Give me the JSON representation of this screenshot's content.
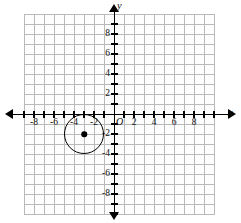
{
  "figure": {
    "type": "coordinate-plane",
    "x_axis_name": "x",
    "y_axis_name": "y",
    "origin_label": "O"
  },
  "axes": {
    "x_range": [
      -9,
      10
    ],
    "y_range": [
      -10,
      9
    ],
    "grid": true,
    "grid_step": 1,
    "tick_step": 1,
    "labeled_step": 2,
    "pixels_per_unit": 10,
    "origin_px": [
      114,
      114
    ],
    "x_tick_labels": [
      "-8",
      "-6",
      "-4",
      "-2",
      "2",
      "4",
      "6",
      "8"
    ],
    "y_tick_labels": [
      "8",
      "6",
      "4",
      "2",
      "-2",
      "-4",
      "-6",
      "-8"
    ],
    "x_tick_values": [
      -8,
      -6,
      -4,
      -2,
      2,
      4,
      6,
      8
    ],
    "y_tick_values": [
      8,
      6,
      4,
      2,
      -2,
      -4,
      -6,
      -8
    ],
    "all_tick_values_x": [
      -9,
      -8,
      -7,
      -6,
      -5,
      -4,
      -3,
      -2,
      -1,
      1,
      2,
      3,
      4,
      5,
      6,
      7,
      8,
      9,
      10
    ],
    "all_tick_values_y": [
      -10,
      -9,
      -8,
      -7,
      -6,
      -5,
      -4,
      -3,
      -2,
      -1,
      1,
      2,
      3,
      4,
      5,
      6,
      7,
      8,
      9
    ]
  },
  "chart_data": {
    "type": "scatter",
    "title": "",
    "xlabel": "x",
    "ylabel": "y",
    "xlim": [
      -9,
      10
    ],
    "ylim": [
      -10,
      9
    ],
    "grid": true,
    "legend": "none",
    "shapes": [
      {
        "kind": "circle",
        "center": [
          -3,
          -2
        ],
        "radius": 2,
        "stroke": "#000000",
        "fill": "none",
        "center_marker": true
      }
    ],
    "points": [
      {
        "label": "center",
        "x": -3,
        "y": -2,
        "marker": "filled-dot"
      }
    ]
  },
  "colors": {
    "grid_line": "#b9b9b9",
    "axis": "#000000",
    "shape_stroke": "#000000",
    "label_text": "#111111",
    "background": "#ffffff"
  }
}
